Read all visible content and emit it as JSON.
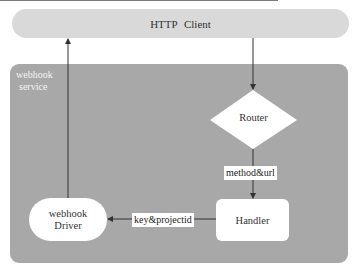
{
  "diagram": {
    "type": "flowchart",
    "nodes": {
      "http_client": {
        "label": "HTTP Client",
        "shape": "pill",
        "fill": "#d9d9d9"
      },
      "service": {
        "label_line1": "webhook",
        "label_line2": "service",
        "shape": "rounded-rect-container",
        "fill": "#a8a8a8"
      },
      "router": {
        "label": "Router",
        "shape": "diamond",
        "fill": "#ffffff"
      },
      "handler": {
        "label": "Handler",
        "shape": "rounded-rect",
        "fill": "#ffffff"
      },
      "driver": {
        "label_line1": "webhook",
        "label_line2": "Driver",
        "shape": "pill",
        "fill": "#ffffff"
      }
    },
    "edges": [
      {
        "from": "HTTP Client",
        "to": "Router",
        "label": ""
      },
      {
        "from": "Router",
        "to": "Handler",
        "label": "method&url"
      },
      {
        "from": "Handler",
        "to": "webhook Driver",
        "label": "key&projectid"
      },
      {
        "from": "webhook Driver",
        "to": "HTTP Client",
        "label": ""
      }
    ],
    "edge_labels": {
      "router_to_handler": "method&url",
      "handler_to_driver": "key&projectid"
    },
    "colors": {
      "line": "#333333",
      "client_fill": "#d9d9d9",
      "service_fill": "#a8a8a8",
      "node_fill": "#ffffff"
    }
  }
}
